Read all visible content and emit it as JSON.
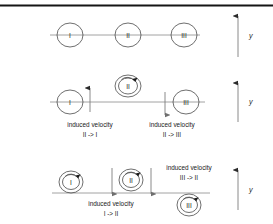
{
  "figure": {
    "width": 273,
    "height": 224,
    "background": "#ffffff",
    "rule_color": "#151515",
    "line_color": "#8a8a8a"
  },
  "panels": [
    {
      "id": "panel-1",
      "caption": "",
      "vortices": [
        {
          "label": "I",
          "position": "on-line",
          "rotation": "none"
        },
        {
          "label": "II",
          "position": "on-line",
          "rotation": "none"
        },
        {
          "label": "III",
          "position": "on-line",
          "rotation": "none"
        }
      ],
      "induced_velocities": [],
      "axis": {
        "label": "y",
        "direction": "up"
      }
    },
    {
      "id": "panel-2",
      "caption": "",
      "vortices": [
        {
          "label": "I",
          "position": "on-line",
          "rotation": "none"
        },
        {
          "label": "II",
          "position": "above-line",
          "rotation": "clockwise"
        },
        {
          "label": "III",
          "position": "on-line",
          "rotation": "none"
        }
      ],
      "induced_velocities": [
        {
          "text_line1": "induced velocity",
          "text_line2": "II -> I",
          "direction": "up"
        },
        {
          "text_line1": "induced velocity",
          "text_line2": "II -> III",
          "direction": "down"
        }
      ],
      "axis": {
        "label": "y",
        "direction": "up"
      }
    },
    {
      "id": "panel-3",
      "caption": "",
      "vortices": [
        {
          "label": "I",
          "position": "above-line",
          "rotation": "clockwise"
        },
        {
          "label": "II",
          "position": "above-line",
          "rotation": "clockwise"
        },
        {
          "label": "III",
          "position": "below-line",
          "rotation": "clockwise"
        }
      ],
      "induced_velocities": [
        {
          "text_line1": "induced velocity",
          "text_line2": "I -> II",
          "direction": "down"
        },
        {
          "text_line1": "induced velocity",
          "text_line2": "III -> II",
          "direction": "down"
        }
      ],
      "axis": {
        "label": "y",
        "direction": "up"
      }
    }
  ],
  "labels": {
    "vortex_1": "I",
    "vortex_2": "II",
    "vortex_3": "III",
    "axis_y": "y",
    "induced": "induced velocity",
    "p2_left": "II -> I",
    "p2_right": "II -> III",
    "p3_left": "I -> II",
    "p3_right": "III -> II"
  }
}
